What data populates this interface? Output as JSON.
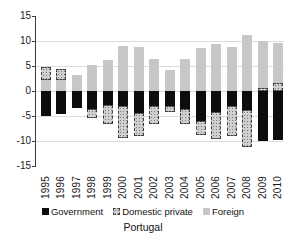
{
  "chart_data": {
    "type": "bar",
    "stacked": true,
    "title": "Portugal",
    "xlabel": "",
    "ylabel": "",
    "ylim": [
      -15,
      15
    ],
    "yticks": [
      15,
      10,
      5,
      0,
      -5,
      -10,
      -15
    ],
    "ytick_labels": [
      "15",
      "10",
      "5",
      "0",
      "-5",
      "-10",
      "-15"
    ],
    "gridlines": [
      10,
      5,
      0,
      -5,
      -10
    ],
    "grid": true,
    "legend_position": "bottom",
    "categories": [
      "1995",
      "1996",
      "1997",
      "1998",
      "1999",
      "2000",
      "2001",
      "2002",
      "2003",
      "2004",
      "2005",
      "2006",
      "2007",
      "2008",
      "2009",
      "2010"
    ],
    "series": [
      {
        "name": "Government",
        "key": "government",
        "color": "#0d0d0d",
        "pattern": "solid-black",
        "values": [
          -5.0,
          -4.5,
          -3.3,
          -3.5,
          -2.7,
          -3.0,
          -4.4,
          -2.9,
          -3.0,
          -3.5,
          -6.0,
          -4.1,
          -3.0,
          -3.7,
          -10.0,
          -9.7
        ]
      },
      {
        "name": "Domestic private",
        "key": "domestic",
        "color": "#cfcfcf",
        "pattern": "stipple-dashed-border",
        "values": [
          2.6,
          2.3,
          0.0,
          -1.9,
          -3.9,
          -6.3,
          -4.5,
          -3.7,
          -1.2,
          -3.0,
          -2.7,
          -5.5,
          -5.9,
          -7.5,
          0.7,
          1.7
        ]
      },
      {
        "name": "Foreign",
        "key": "foreign",
        "color": "#e0e0e0",
        "pattern": "light-stipple",
        "values": [
          2.2,
          2.2,
          3.2,
          5.2,
          6.3,
          9.0,
          8.9,
          6.5,
          4.3,
          6.4,
          8.7,
          9.4,
          8.8,
          11.3,
          9.3,
          8.0
        ]
      }
    ],
    "segments": [
      [
        {
          "s": "foreign",
          "from": 0,
          "to": 2.2
        },
        {
          "s": "domestic",
          "from": 2.2,
          "to": 4.8
        },
        {
          "s": "government",
          "from": 0,
          "to": -5.0
        }
      ],
      [
        {
          "s": "foreign",
          "from": 0,
          "to": 2.2
        },
        {
          "s": "domestic",
          "from": 2.2,
          "to": 4.5
        },
        {
          "s": "government",
          "from": 0,
          "to": -4.5
        }
      ],
      [
        {
          "s": "foreign",
          "from": 0,
          "to": 3.2
        },
        {
          "s": "government",
          "from": 0,
          "to": -3.3
        }
      ],
      [
        {
          "s": "foreign",
          "from": 0,
          "to": 5.2
        },
        {
          "s": "government",
          "from": 0,
          "to": -3.5
        },
        {
          "s": "domestic",
          "from": -3.5,
          "to": -5.4
        }
      ],
      [
        {
          "s": "foreign",
          "from": 0,
          "to": 6.3
        },
        {
          "s": "government",
          "from": 0,
          "to": -2.7
        },
        {
          "s": "domestic",
          "from": -2.7,
          "to": -6.6
        }
      ],
      [
        {
          "s": "foreign",
          "from": 0,
          "to": 9.0
        },
        {
          "s": "government",
          "from": 0,
          "to": -3.0
        },
        {
          "s": "domestic",
          "from": -3.0,
          "to": -9.3
        }
      ],
      [
        {
          "s": "foreign",
          "from": 0,
          "to": 8.9
        },
        {
          "s": "government",
          "from": 0,
          "to": -4.4
        },
        {
          "s": "domestic",
          "from": -4.4,
          "to": -8.9
        }
      ],
      [
        {
          "s": "foreign",
          "from": 0,
          "to": 6.5
        },
        {
          "s": "government",
          "from": 0,
          "to": -2.9
        },
        {
          "s": "domestic",
          "from": -2.9,
          "to": -6.6
        }
      ],
      [
        {
          "s": "foreign",
          "from": 0,
          "to": 4.3
        },
        {
          "s": "government",
          "from": 0,
          "to": -3.0
        },
        {
          "s": "domestic",
          "from": -3.0,
          "to": -4.2
        }
      ],
      [
        {
          "s": "foreign",
          "from": 0,
          "to": 6.4
        },
        {
          "s": "government",
          "from": 0,
          "to": -3.5
        },
        {
          "s": "domestic",
          "from": -3.5,
          "to": -6.5
        }
      ],
      [
        {
          "s": "foreign",
          "from": 0,
          "to": 8.7
        },
        {
          "s": "government",
          "from": 0,
          "to": -6.0
        },
        {
          "s": "domestic",
          "from": -6.0,
          "to": -8.7
        }
      ],
      [
        {
          "s": "foreign",
          "from": 0,
          "to": 9.4
        },
        {
          "s": "government",
          "from": 0,
          "to": -4.1
        },
        {
          "s": "domestic",
          "from": -4.1,
          "to": -9.6
        }
      ],
      [
        {
          "s": "foreign",
          "from": 0,
          "to": 8.8
        },
        {
          "s": "government",
          "from": 0,
          "to": -3.0
        },
        {
          "s": "domestic",
          "from": -3.0,
          "to": -8.9
        }
      ],
      [
        {
          "s": "foreign",
          "from": 0,
          "to": 11.3
        },
        {
          "s": "government",
          "from": 0,
          "to": -3.7
        },
        {
          "s": "domestic",
          "from": -3.7,
          "to": -11.2
        }
      ],
      [
        {
          "s": "domestic",
          "from": 0,
          "to": 0.7
        },
        {
          "s": "foreign",
          "from": 0.7,
          "to": 10.0
        },
        {
          "s": "government",
          "from": 0,
          "to": -10.0
        }
      ],
      [
        {
          "s": "domestic",
          "from": 0,
          "to": 1.7
        },
        {
          "s": "foreign",
          "from": 1.7,
          "to": 9.7
        },
        {
          "s": "government",
          "from": 0,
          "to": -9.7
        }
      ]
    ]
  },
  "legend": {
    "items": [
      {
        "label": "Government"
      },
      {
        "label": "Domestic private"
      },
      {
        "label": "Foreign"
      }
    ]
  },
  "title": "Portugal"
}
